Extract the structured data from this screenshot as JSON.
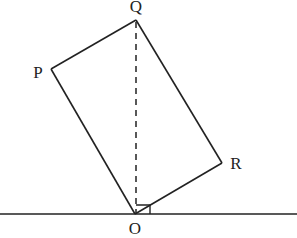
{
  "diagram": {
    "type": "geometry",
    "points": {
      "P": {
        "label": "P",
        "x": 51,
        "y": 69
      },
      "Q": {
        "label": "Q",
        "x": 136,
        "y": 20
      },
      "R": {
        "label": "R",
        "x": 222,
        "y": 163
      },
      "O": {
        "label": "O",
        "x": 135,
        "y": 214
      }
    },
    "labels": {
      "P": "P",
      "Q": "Q",
      "R": "R",
      "O": "O"
    },
    "colors": {
      "stroke": "#222222",
      "background": "#ffffff"
    }
  }
}
